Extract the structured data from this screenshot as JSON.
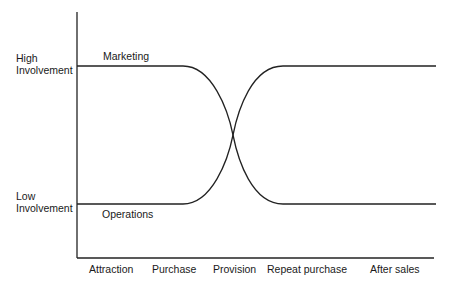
{
  "diagram": {
    "y_labels": {
      "high": [
        "High",
        "Involvement"
      ],
      "low": [
        "Low",
        "Involvement"
      ]
    },
    "series": [
      {
        "name": "Marketing",
        "start": "high",
        "end": "low"
      },
      {
        "name": "Operations",
        "start": "low",
        "end": "high"
      }
    ],
    "x_labels": [
      "Attraction",
      "Purchase",
      "Provision",
      "Repeat purchase",
      "After sales"
    ],
    "colors": {
      "line": "#222222",
      "text": "#1a1a1a"
    }
  }
}
